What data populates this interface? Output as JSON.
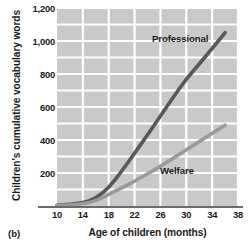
{
  "panel": {
    "label": "(b)"
  },
  "chart_data": {
    "type": "line",
    "title": "",
    "xlabel": "Age of children (months)",
    "ylabel": "Children's cumulative vocabulary words",
    "xlim": [
      10,
      38
    ],
    "ylim": [
      0,
      1200
    ],
    "xticks": [
      10,
      14,
      18,
      22,
      26,
      30,
      34,
      38
    ],
    "xtick_labels": [
      "10",
      "14",
      "18",
      "22",
      "26",
      "30",
      "34",
      "38"
    ],
    "yticks": [
      200,
      400,
      600,
      800,
      1000,
      1200
    ],
    "ytick_labels": [
      "200",
      "400",
      "600",
      "800",
      "1,000",
      "1,200"
    ],
    "grid": true,
    "grid_color": "#ffffff",
    "plot_background": "#c9c9c9",
    "legend_position": "inline-annotation",
    "series": [
      {
        "name": "Professional",
        "color": "#585858",
        "label": "Professional",
        "x": [
          10,
          12,
          14,
          16,
          18,
          20,
          22,
          24,
          26,
          28,
          30,
          32,
          34,
          36
        ],
        "values": [
          5,
          10,
          20,
          45,
          110,
          210,
          320,
          430,
          545,
          660,
          770,
          860,
          955,
          1050
        ]
      },
      {
        "name": "Welfare",
        "color": "#9a9a9a",
        "label": "Welfare",
        "x": [
          10,
          12,
          14,
          16,
          18,
          20,
          22,
          24,
          26,
          28,
          30,
          32,
          34,
          36
        ],
        "values": [
          3,
          6,
          12,
          30,
          70,
          110,
          150,
          195,
          240,
          290,
          340,
          390,
          440,
          490
        ]
      }
    ]
  }
}
